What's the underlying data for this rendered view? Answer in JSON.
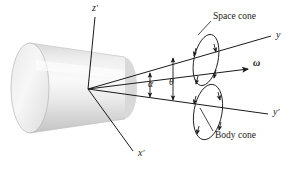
{
  "figure": {
    "background_color": "#ffffff",
    "line_color": "#1a1a1a",
    "body_fill_light": "#f2f2f2",
    "body_fill_mid": "#e0e0e0",
    "body_fill_dark": "#c9c9c9"
  },
  "axes": [
    {
      "id": "z-prime",
      "label": "z",
      "prime": "′",
      "x": 92,
      "y": 7
    },
    {
      "id": "x-prime",
      "label": "x",
      "prime": "′",
      "x": 138,
      "y": 152
    },
    {
      "id": "y",
      "label": "y",
      "prime": "",
      "x": 276,
      "y": 34
    },
    {
      "id": "y-prime",
      "label": "y",
      "prime": "′",
      "x": 273,
      "y": 111
    }
  ],
  "vectors": [
    {
      "id": "omega",
      "label": "ω",
      "x": 253,
      "y": 62
    }
  ],
  "angles": [
    {
      "id": "alpha",
      "label": "α",
      "x": 148,
      "y": 84
    },
    {
      "id": "theta",
      "label": "θ",
      "x": 169,
      "y": 82
    }
  ],
  "annotations": [
    {
      "id": "space-cone",
      "label": "Space cone",
      "x": 213,
      "y": 17
    },
    {
      "id": "body-cone",
      "label": "Body cone",
      "x": 215,
      "y": 135
    }
  ],
  "geometry": {
    "apex": {
      "x": 88,
      "y": 89
    },
    "cylinder": {
      "axis_angle_deg": -14,
      "length": 112,
      "radius_y": 44
    },
    "space_cone_ellipse": {
      "cx": 206,
      "cy": 60,
      "rx": 12,
      "ry": 26,
      "rotation_deg": 12
    },
    "body_cone_ellipse": {
      "cx": 208,
      "cy": 112,
      "rx": 14,
      "ry": 28,
      "rotation_deg": 10
    }
  }
}
